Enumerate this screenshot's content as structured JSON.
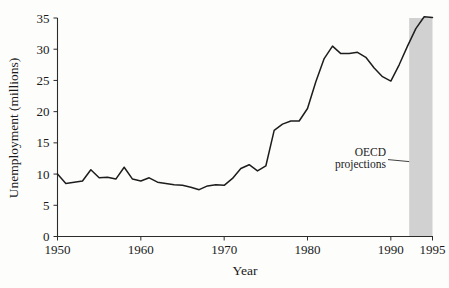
{
  "chart_data": {
    "type": "line",
    "title": "",
    "subtitle": "",
    "xlabel": "Year",
    "ylabel": "Unemployment (millions)",
    "xlim": [
      1950,
      1995
    ],
    "ylim": [
      0,
      35
    ],
    "grid": false,
    "legend_position": "none",
    "x_ticks": [
      "1950",
      "1960",
      "1970",
      "1980",
      "1990",
      "1995"
    ],
    "x_tick_values": [
      1950,
      1960,
      1970,
      1980,
      1990,
      1995
    ],
    "y_ticks": [
      "0",
      "5",
      "10",
      "15",
      "20",
      "25",
      "30",
      "35"
    ],
    "y_tick_values": [
      0,
      5,
      10,
      15,
      20,
      25,
      30,
      35
    ],
    "series": [
      {
        "name": "Unemployment",
        "color": "#1d1d1d",
        "x": [
          1950,
          1951,
          1952,
          1953,
          1954,
          1955,
          1956,
          1957,
          1958,
          1959,
          1960,
          1961,
          1962,
          1963,
          1964,
          1965,
          1966,
          1967,
          1968,
          1969,
          1970,
          1971,
          1972,
          1973,
          1974,
          1975,
          1976,
          1977,
          1978,
          1979,
          1980,
          1981,
          1982,
          1983,
          1984,
          1985,
          1986,
          1987,
          1988,
          1989,
          1990,
          1991,
          1992,
          1993,
          1994,
          1995
        ],
        "values": [
          10.0,
          8.5,
          8.7,
          8.9,
          10.7,
          9.4,
          9.5,
          9.2,
          11.1,
          9.2,
          8.9,
          9.4,
          8.7,
          8.5,
          8.3,
          8.2,
          7.9,
          7.5,
          8.1,
          8.3,
          8.2,
          9.3,
          10.9,
          11.5,
          10.5,
          11.3,
          17.0,
          18.0,
          18.5,
          18.5,
          20.5,
          24.8,
          28.5,
          30.5,
          29.3,
          29.3,
          29.5,
          28.7,
          27.0,
          25.6,
          24.9,
          27.5,
          30.5,
          33.3,
          35.2,
          35.1
        ]
      }
    ],
    "annotations": [
      {
        "name": "oecd-projections",
        "text_line_1": "OECD",
        "text_line_2": "projections",
        "points_to_year": 1992,
        "points_to_value": 12
      }
    ],
    "shaded_regions": [
      {
        "name": "projection-band",
        "label": "OECD projections",
        "x_start": 1992.2,
        "x_end": 1995,
        "y_start": 0,
        "y_end": 35,
        "color": "#c9c9c9"
      }
    ]
  }
}
